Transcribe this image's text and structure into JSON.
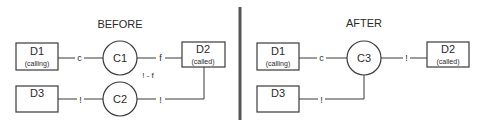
{
  "panels": {
    "before": {
      "title": "BEFORE",
      "nodes": {
        "d1": {
          "name": "D1",
          "sub": "(calling)"
        },
        "d2": {
          "name": "D2",
          "sub": "(called)"
        },
        "d3": {
          "name": "D3"
        },
        "c1": {
          "name": "C1"
        },
        "c2": {
          "name": "C2"
        }
      },
      "edges": {
        "d1_c1": "c",
        "c1_d2": "f",
        "c1_extra": "! - f",
        "d3_c2": "!",
        "c2_d2": "!"
      }
    },
    "after": {
      "title": "AFTER",
      "nodes": {
        "d1": {
          "name": "D1",
          "sub": "(calling)"
        },
        "d2": {
          "name": "D2",
          "sub": "(called)"
        },
        "d3": {
          "name": "D3"
        },
        "c3": {
          "name": "C3"
        }
      },
      "edges": {
        "d1_c3": "c",
        "c3_d2": "!",
        "d3_c3": "!"
      }
    }
  },
  "colors": {
    "stroke": "#3a3a3a",
    "divider": "#555555",
    "text": "#2a2a2a"
  }
}
